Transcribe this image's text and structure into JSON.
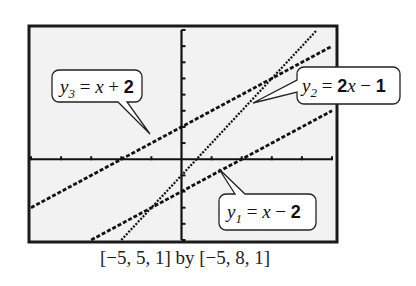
{
  "chart_data": {
    "type": "line",
    "title": "",
    "window_caption": "[−5, 5, 1] by [−5, 8, 1]",
    "xlim": [
      -5,
      5
    ],
    "xscale": 1,
    "ylim": [
      -5,
      8
    ],
    "yscale": 1,
    "grid": false,
    "legend": "callouts",
    "series": [
      {
        "name": "y1",
        "label": "y₁ = x − 2",
        "equation": "x - 2",
        "slope": 1,
        "intercept": -2,
        "style": "dashed-thick",
        "x": [
          -3,
          5
        ],
        "y": [
          -5,
          3
        ]
      },
      {
        "name": "y2",
        "label": "y₂ = 2x − 1",
        "equation": "2x - 1",
        "slope": 2,
        "intercept": -1,
        "style": "dotted",
        "x": [
          -2,
          4.5
        ],
        "y": [
          -5,
          8
        ]
      },
      {
        "name": "y3",
        "label": "y₃ = x + 2",
        "equation": "x + 2",
        "slope": 1,
        "intercept": 2,
        "style": "dashed-thick",
        "x": [
          -5,
          5
        ],
        "y": [
          -3,
          7
        ]
      }
    ]
  },
  "labels": {
    "y3": {
      "var": "y",
      "sub": "3",
      "eq": " = ",
      "rhs_var": "x",
      "rhs_op": " + ",
      "rhs_num": "2"
    },
    "y2": {
      "var": "y",
      "sub": "2",
      "eq": " = ",
      "rhs_num1": "2",
      "rhs_var": "x",
      "rhs_op": " − ",
      "rhs_num": "1"
    },
    "y1": {
      "var": "y",
      "sub": "1",
      "eq": " = ",
      "rhs_var": "x",
      "rhs_op": " − ",
      "rhs_num": "2"
    }
  },
  "caption": "[−5, 5, 1] by [−5, 8, 1]",
  "colors": {
    "frame": "#1a1a1a",
    "screen": "#f2f2f2",
    "line": "#111111"
  }
}
